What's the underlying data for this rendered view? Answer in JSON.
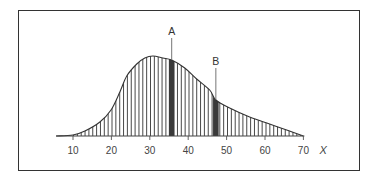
{
  "chart_data": {
    "type": "area",
    "title": "",
    "xlabel": "X",
    "ylabel": "",
    "xlim": [
      5.6,
      70
    ],
    "x_ticks": [
      10,
      20,
      30,
      40,
      50,
      60,
      70
    ],
    "grid": false,
    "legend": null,
    "fill_style": "vertical-hatch",
    "series": [
      {
        "name": "density",
        "x": [
          5.6,
          10,
          13.1,
          17.0,
          19.9,
          22.2,
          24.0,
          26.6,
          28.7,
          30.8,
          33.4,
          35.7,
          39.1,
          42.2,
          45.6,
          47.2,
          50.8,
          56.0,
          61.2,
          66.4,
          70
        ],
        "y": [
          0,
          1,
          5,
          14,
          26,
          44,
          60,
          72,
          78,
          80,
          78,
          76,
          68,
          57,
          46,
          36,
          28,
          19,
          12,
          5,
          0
        ]
      }
    ],
    "annotations": [
      {
        "label": "A",
        "x": 35.7,
        "highlight": "dark vertical band"
      },
      {
        "label": "B",
        "x": 47.2,
        "highlight": "dark vertical band"
      }
    ]
  },
  "labels": {
    "x_axis_name": "X",
    "ticks": [
      "10",
      "20",
      "30",
      "40",
      "50",
      "60",
      "70"
    ],
    "marker_a": "A",
    "marker_b": "B"
  }
}
